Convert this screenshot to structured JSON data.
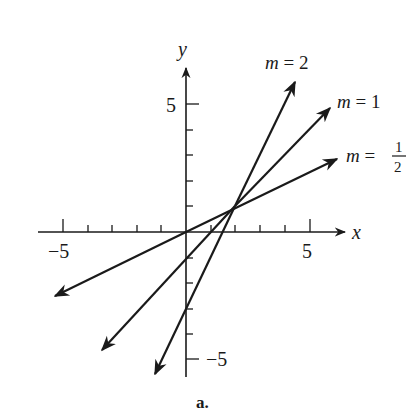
{
  "chart_data": {
    "type": "line",
    "title": "",
    "caption": "a.",
    "xlabel": "x",
    "ylabel": "y",
    "xlim": [
      -6,
      6.5
    ],
    "ylim": [
      -6,
      6.5
    ],
    "xticks": [
      -5,
      -4,
      -3,
      -2,
      -1,
      1,
      2,
      3,
      4,
      5
    ],
    "yticks": [
      -5,
      -4,
      -3,
      -2,
      -1,
      1,
      2,
      3,
      4,
      5
    ],
    "x_tick_labels": [
      "-5",
      "5"
    ],
    "y_tick_labels": [
      "5",
      "-5"
    ],
    "grid": false,
    "legend": "inline labels at upper arrow ends",
    "common_point": [
      2,
      1
    ],
    "series": [
      {
        "name": "m = 2",
        "slope": 2,
        "intercept": -3,
        "equation": "y = 2x - 3",
        "x": [
          -1.3,
          4.4
        ],
        "y": [
          -5.6,
          5.8
        ]
      },
      {
        "name": "m = 1",
        "slope": 1,
        "intercept": -1,
        "equation": "y = x - 1",
        "x": [
          -3.4,
          5.8
        ],
        "y": [
          -4.6,
          4.8
        ]
      },
      {
        "name": "m = 1/2",
        "slope": 0.5,
        "intercept": 0,
        "equation": "y = x/2",
        "x": [
          -5.3,
          6.1
        ],
        "y": [
          -2.5,
          2.9
        ]
      }
    ]
  },
  "labels": {
    "x_axis": "x",
    "y_axis": "y",
    "x_neg5": "−5",
    "x_pos5": "5",
    "y_pos5": "5",
    "y_neg5": "−5",
    "m2": "m = 2",
    "m1": "m = 1",
    "m_half_prefix": "m =",
    "m_half_num": "1",
    "m_half_den": "2",
    "caption": "a."
  },
  "colors": {
    "ink": "#1a1a1a",
    "background": "#ffffff"
  }
}
